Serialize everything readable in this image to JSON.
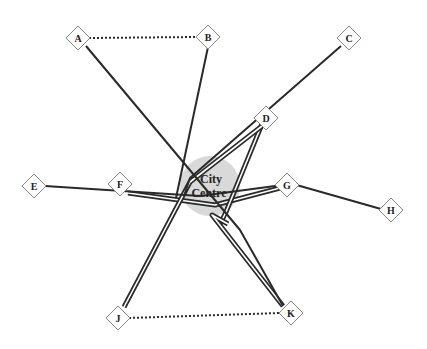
{
  "diagram": {
    "title": "",
    "centre": {
      "label_line1": "City",
      "label_line2": "Centre",
      "x": 210,
      "y": 186,
      "r": 30,
      "fill": "#d9d9d9"
    },
    "colors": {
      "line": "#2a2a2a",
      "node_border": "#888888",
      "node_fill": "#ffffff"
    },
    "nodes": [
      {
        "id": "A",
        "label": "A",
        "x": 78,
        "y": 38
      },
      {
        "id": "B",
        "label": "B",
        "x": 208,
        "y": 37
      },
      {
        "id": "C",
        "label": "C",
        "x": 349,
        "y": 38
      },
      {
        "id": "D",
        "label": "D",
        "x": 266,
        "y": 118
      },
      {
        "id": "E",
        "label": "E",
        "x": 34,
        "y": 186
      },
      {
        "id": "F",
        "label": "F",
        "x": 120,
        "y": 184
      },
      {
        "id": "G",
        "label": "G",
        "x": 287,
        "y": 185
      },
      {
        "id": "H",
        "label": "H",
        "x": 391,
        "y": 210
      },
      {
        "id": "J",
        "label": "J",
        "x": 118,
        "y": 318
      },
      {
        "id": "K",
        "label": "K",
        "x": 291,
        "y": 313
      }
    ],
    "single_links": [
      {
        "from": "A",
        "to": "K",
        "path": [
          [
            86,
            46
          ],
          [
            240,
            230
          ],
          [
            283,
            306
          ]
        ]
      },
      {
        "from": "B",
        "to": "city",
        "path": [
          [
            208,
            47
          ],
          [
            176,
            198
          ]
        ]
      },
      {
        "from": "C",
        "to": "city",
        "path": [
          [
            341,
            46
          ],
          [
            190,
            178
          ],
          [
            184,
            196
          ]
        ]
      },
      {
        "from": "E",
        "to": "G",
        "path": [
          [
            45,
            186
          ],
          [
            200,
            196
          ],
          [
            275,
            186
          ],
          [
            293,
            184
          ],
          [
            381,
            209
          ]
        ]
      }
    ],
    "double_links": [
      {
        "from": "F",
        "to": "G",
        "path": [
          [
            128,
            193
          ],
          [
            215,
            205
          ],
          [
            280,
            188
          ]
        ]
      },
      {
        "from": "D",
        "to": "city",
        "path": [
          [
            262,
            124
          ],
          [
            226,
            212
          ],
          [
            220,
            224
          ]
        ]
      },
      {
        "from": "J",
        "to": "D",
        "path": [
          [
            124,
            307
          ],
          [
            190,
            182
          ],
          [
            262,
            126
          ]
        ]
      },
      {
        "from": "K",
        "to": "city",
        "path": [
          [
            283,
            306
          ],
          [
            212,
            215
          ],
          [
            228,
            224
          ]
        ]
      }
    ],
    "dotted_links": [
      {
        "from": "A",
        "to": "B",
        "x1": 89,
        "y1": 38,
        "x2": 197,
        "y2": 37
      },
      {
        "from": "J",
        "to": "K",
        "x1": 129,
        "y1": 318,
        "x2": 280,
        "y2": 313
      }
    ]
  }
}
